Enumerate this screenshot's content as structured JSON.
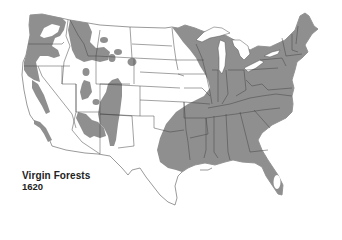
{
  "map": {
    "title": "Virgin Forests",
    "year": "1620",
    "region": "Contiguous United States",
    "colors": {
      "forest": "#8f8f8f",
      "land": "#ffffff",
      "border": "#444444",
      "text": "#222222"
    },
    "legend": {
      "shaded_area_meaning": "virgin forest"
    }
  }
}
